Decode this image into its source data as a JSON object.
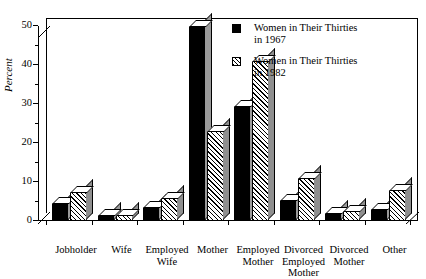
{
  "chart_data": {
    "type": "bar",
    "title": "",
    "xlabel": "",
    "ylabel": "Percent",
    "ylim": [
      0,
      50
    ],
    "yticks": [
      0,
      10,
      20,
      30,
      40,
      50
    ],
    "ytick_labels": [
      "0",
      "10",
      "20",
      "30",
      "40",
      "50"
    ],
    "minor_tick_step": 5,
    "grid": false,
    "legend_position": "upper right",
    "categories": [
      "Jobholder",
      "Wife",
      "Employed\nWife",
      "Mother",
      "Employed\nMother",
      "Divorced\nEmployed\nMother",
      "Divorced\nMother",
      "Other"
    ],
    "series": [
      {
        "name": "Women in Their Thirties\nin 1967",
        "color": "#000000",
        "fill": "solid-black",
        "values": [
          4.5,
          1.5,
          3.5,
          50.0,
          29.5,
          5.5,
          2.0,
          3.0
        ]
      },
      {
        "name": "Women in Their Thirties\nin 1982",
        "color": "#ffffff",
        "fill": "diagonal-hatch",
        "values": [
          7.5,
          1.5,
          6.0,
          23.0,
          41.0,
          11.0,
          2.5,
          8.0
        ]
      }
    ]
  },
  "legend": {
    "entries": [
      {
        "label": "Women in Their Thirties\nin 1967",
        "swatch": "solid-black-swatch"
      },
      {
        "label": "Women in Their Thirties\nin 1982",
        "swatch": "hatched-swatch"
      }
    ]
  },
  "axis": {
    "y_title": "Percent"
  }
}
